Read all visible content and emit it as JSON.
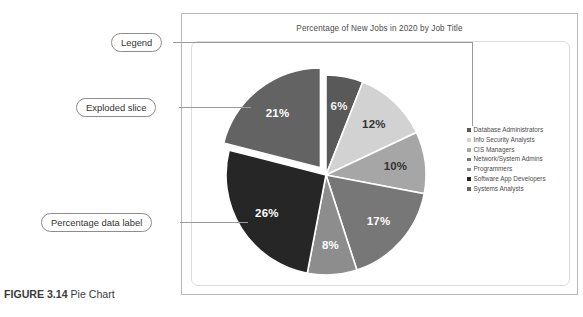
{
  "figure": {
    "caption_label": "FIGURE 3.14",
    "caption_text": " Pie Chart"
  },
  "callouts": [
    {
      "id": "legend",
      "label": "Legend"
    },
    {
      "id": "exploded",
      "label": "Exploded slice"
    },
    {
      "id": "datalabel",
      "label": "Percentage data label"
    }
  ],
  "chart_data": {
    "type": "pie",
    "title": "Percentage of New Jobs in 2020 by Job Title",
    "xlabel": "",
    "ylabel": "",
    "legend_position": "right",
    "grid": false,
    "categories": [
      "Database Administrators",
      "Info Security Analysts",
      "CIS Managers",
      "Network/System Admins",
      "Programmers",
      "Software App Developers",
      "Systems Analysts"
    ],
    "values": [
      6,
      12,
      10,
      17,
      8,
      26,
      21
    ],
    "data_labels": [
      "6%",
      "12%",
      "10%",
      "17%",
      "8%",
      "26%",
      "21%"
    ],
    "colors": [
      "#595959",
      "#d2d2d2",
      "#a6a6a6",
      "#777777",
      "#8d8d8d",
      "#262626",
      "#636363"
    ],
    "label_text_colors": [
      "#f2f2f2",
      "#333333",
      "#333333",
      "#ffffff",
      "#ffffff",
      "#ffffff",
      "#ffffff"
    ],
    "exploded_slice": "Systems Analysts",
    "exploded_index": 6,
    "start_angle_deg": 0,
    "direction": "clockwise"
  }
}
